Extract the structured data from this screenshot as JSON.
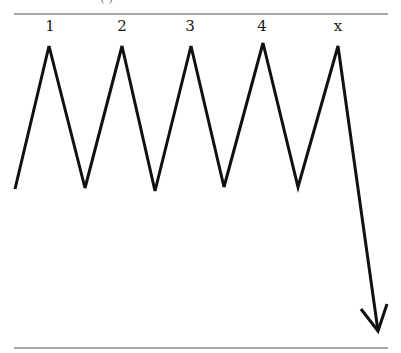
{
  "diagram": {
    "title_fragment": "(          )",
    "wave_labels": [
      {
        "text": "1",
        "x": 50,
        "y": 17
      },
      {
        "text": "2",
        "x": 122,
        "y": 17
      },
      {
        "text": "3",
        "x": 190,
        "y": 17
      },
      {
        "text": "4",
        "x": 262,
        "y": 17
      },
      {
        "text": "x",
        "x": 338,
        "y": 17
      }
    ],
    "line_color": "#111111",
    "rule_color": "#8a8a8a",
    "zigzag_points": [
      [
        15,
        189
      ],
      [
        49,
        46
      ],
      [
        85,
        188
      ],
      [
        122,
        46
      ],
      [
        155,
        191
      ],
      [
        191,
        46
      ],
      [
        224,
        187
      ],
      [
        263,
        43
      ],
      [
        298,
        187
      ],
      [
        338,
        46
      ],
      [
        378,
        331
      ]
    ],
    "arrow_head": {
      "tip": [
        378,
        331
      ],
      "left": [
        361,
        309
      ],
      "right": [
        387,
        304
      ]
    },
    "top_rule": {
      "x1": 14,
      "x2": 388,
      "y": 14
    },
    "bottom_rule": {
      "x1": 14,
      "x2": 388,
      "y": 348
    }
  }
}
